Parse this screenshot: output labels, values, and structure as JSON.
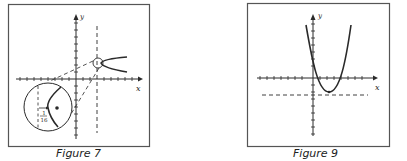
{
  "figures": [
    {
      "id": "figure-7",
      "caption": "Figure 7",
      "axis_labels": {
        "x": "x",
        "y": "y"
      },
      "inset_label_numerator": "1",
      "inset_label_denominator": "16"
    },
    {
      "id": "figure-9",
      "caption": "Figure 9",
      "axis_labels": {
        "x": "x",
        "y": "y"
      }
    }
  ],
  "colors": {
    "ink": "#2a2a2a",
    "frame": "#555555",
    "background": "#ffffff"
  }
}
